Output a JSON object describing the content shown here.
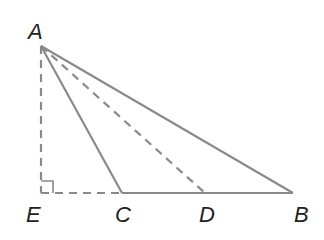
{
  "diagram": {
    "type": "geometry-triangle",
    "colors": {
      "line": "#8a8a8a",
      "label": "#222222",
      "background": "#ffffff"
    },
    "points": {
      "A": {
        "label": "A",
        "x": 41,
        "y": 46
      },
      "E": {
        "label": "E",
        "x": 40,
        "y": 193
      },
      "C": {
        "label": "C",
        "x": 122,
        "y": 193
      },
      "D": {
        "label": "D",
        "x": 205,
        "y": 193
      },
      "B": {
        "label": "B",
        "x": 293,
        "y": 193
      }
    },
    "segments": [
      {
        "from": "A",
        "to": "B",
        "style": "solid"
      },
      {
        "from": "A",
        "to": "C",
        "style": "solid"
      },
      {
        "from": "C",
        "to": "B",
        "style": "solid"
      },
      {
        "from": "A",
        "to": "D",
        "style": "dashed"
      },
      {
        "from": "A",
        "to": "E",
        "style": "dashed"
      },
      {
        "from": "E",
        "to": "C",
        "style": "dashed"
      }
    ],
    "right_angle_at": "E"
  }
}
